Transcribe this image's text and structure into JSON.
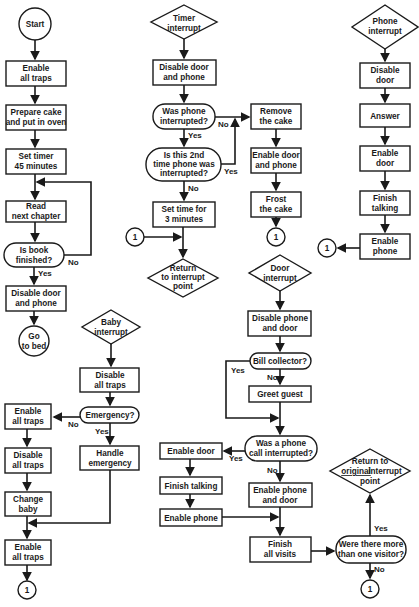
{
  "main_program": {
    "start": "Start",
    "enable_all_traps": [
      "Enable",
      "all traps"
    ],
    "prepare_cake": [
      "Prepare cake",
      "and put in oven"
    ],
    "set_timer": [
      "Set timer",
      "45 minutes"
    ],
    "read_chapter": [
      "Read",
      "next chapter"
    ],
    "book_finished": [
      "Is book",
      "finished?"
    ],
    "no_label": "No",
    "yes_label": "Yes",
    "disable_door_phone": [
      "Disable door",
      "and phone"
    ],
    "go_to_bed": [
      "Go",
      "to bed"
    ]
  },
  "timer_interrupt": {
    "entry": [
      "Timer",
      "interrupt"
    ],
    "disable_door_phone": [
      "Disable door",
      "and phone"
    ],
    "was_phone_interrupted": [
      "Was phone",
      "interrupted?"
    ],
    "no_label": "No",
    "yes_label": "Yes",
    "second_time": [
      "Is this 2nd",
      "time phone was",
      "interrupted?"
    ],
    "yes2_label": "Yes",
    "no2_label": "No",
    "set_time": [
      "Set time for",
      "3 minutes"
    ],
    "connector": "1",
    "return_point": [
      "Return",
      "to interrupt",
      "point"
    ],
    "remove_cake": [
      "Remove",
      "the cake"
    ],
    "enable_door_phone": [
      "Enable door",
      "and phone"
    ],
    "frost_cake": [
      "Frost",
      "the cake"
    ],
    "connector2": "1"
  },
  "phone_interrupt": {
    "entry": [
      "Phone",
      "interrupt"
    ],
    "disable_door": [
      "Disable",
      "door"
    ],
    "answer": "Answer",
    "enable_door": [
      "Enable",
      "door"
    ],
    "finish_talking": [
      "Finish",
      "talking"
    ],
    "enable_phone": [
      "Enable",
      "phone"
    ],
    "connector": "1"
  },
  "baby_interrupt": {
    "entry": [
      "Baby",
      "interrupt"
    ],
    "disable_all_traps": [
      "Disable",
      "all traps"
    ],
    "emergency": "Emergency?",
    "no_label": "No",
    "yes_label": "Yes",
    "handle_emergency": [
      "Handle",
      "emergency"
    ],
    "enable_all_traps": [
      "Enable",
      "all traps"
    ],
    "disable_all_traps2": [
      "Disable",
      "all traps"
    ],
    "change_baby": [
      "Change",
      "baby"
    ],
    "enable_all_traps2": [
      "Enable",
      "all traps"
    ],
    "connector": "1"
  },
  "door_interrupt": {
    "entry": [
      "Door",
      "interrupt"
    ],
    "disable_phone_door": [
      "Disable phone",
      "and door"
    ],
    "bill_collector": "Bill collector?",
    "yes_label": "Yes",
    "no_label": "No",
    "greet_guest": "Greet guest",
    "phone_call_interrupted": [
      "Was a phone",
      "call interrupted?"
    ],
    "yes2_label": "Yes",
    "no2_label": "No",
    "enable_door": "Enable door",
    "finish_talking": "Finish talking",
    "enable_phone": "Enable phone",
    "enable_phone_door": [
      "Enable phone",
      "and door"
    ],
    "finish_visits": [
      "Finish",
      "all visits"
    ],
    "more_than_one": [
      "Were there more",
      "than one visitor?"
    ],
    "yes3_label": "Yes",
    "no3_label": "No",
    "return_original": [
      "Return to",
      "original",
      "interrupt",
      "point"
    ],
    "connector": "1"
  }
}
